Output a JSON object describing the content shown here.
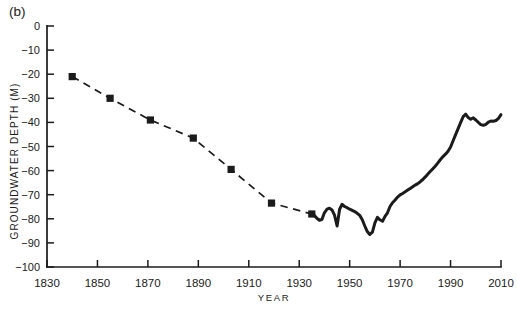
{
  "figure": {
    "background": "#ffffff",
    "ink_color": "#1b1b1b"
  },
  "chart_data": {
    "type": "line",
    "panel_label": "(b)",
    "title": "",
    "xlabel": "YEAR",
    "ylabel": "GROUNDWATER DEPTH (M)",
    "xlim": [
      1830,
      2010
    ],
    "ylim": [
      -100,
      0
    ],
    "x_ticks": [
      1830,
      1850,
      1870,
      1890,
      1910,
      1930,
      1950,
      1970,
      1990,
      2010
    ],
    "y_ticks": [
      0,
      -10,
      -20,
      -30,
      -40,
      -50,
      -60,
      -70,
      -80,
      -90,
      -100
    ],
    "grid": false,
    "legend": "none",
    "series": [
      {
        "name": "historical spot measurements",
        "style": "dashed",
        "marker": "filled-square",
        "points": [
          [
            1840,
            -21
          ],
          [
            1855,
            -30
          ],
          [
            1871,
            -39
          ],
          [
            1888,
            -46.5
          ],
          [
            1903,
            -59.5
          ],
          [
            1919,
            -73.5
          ],
          [
            1935,
            -78
          ]
        ]
      },
      {
        "name": "continuous record",
        "style": "solid",
        "marker": "none",
        "points": [
          [
            1935,
            -78
          ],
          [
            1936,
            -78.6
          ],
          [
            1937,
            -79.8
          ],
          [
            1938,
            -80.6
          ],
          [
            1939,
            -80.3
          ],
          [
            1940,
            -77.5
          ],
          [
            1941,
            -76
          ],
          [
            1942,
            -75.6
          ],
          [
            1943,
            -76.3
          ],
          [
            1944,
            -78.5
          ],
          [
            1945,
            -83
          ],
          [
            1946,
            -76
          ],
          [
            1947,
            -74
          ],
          [
            1948,
            -74.9
          ],
          [
            1949,
            -75.4
          ],
          [
            1950,
            -76
          ],
          [
            1951,
            -76.5
          ],
          [
            1952,
            -77
          ],
          [
            1953,
            -77.7
          ],
          [
            1954,
            -78.6
          ],
          [
            1955,
            -80.4
          ],
          [
            1956,
            -83
          ],
          [
            1957,
            -85.3
          ],
          [
            1958,
            -86.5
          ],
          [
            1959,
            -85.5
          ],
          [
            1960,
            -81.7
          ],
          [
            1961,
            -79.4
          ],
          [
            1962,
            -80.4
          ],
          [
            1963,
            -81
          ],
          [
            1964,
            -79
          ],
          [
            1965,
            -77.5
          ],
          [
            1966,
            -74.9
          ],
          [
            1967,
            -73.3
          ],
          [
            1968,
            -72.2
          ],
          [
            1969,
            -71
          ],
          [
            1970,
            -70.1
          ],
          [
            1971,
            -69.5
          ],
          [
            1972,
            -68.8
          ],
          [
            1973,
            -68.1
          ],
          [
            1974,
            -67.4
          ],
          [
            1975,
            -66.7
          ],
          [
            1976,
            -66
          ],
          [
            1977,
            -65.4
          ],
          [
            1978,
            -64.6
          ],
          [
            1979,
            -63.7
          ],
          [
            1980,
            -62.6
          ],
          [
            1981,
            -61.4
          ],
          [
            1982,
            -60.3
          ],
          [
            1983,
            -59.2
          ],
          [
            1984,
            -58.1
          ],
          [
            1985,
            -56.8
          ],
          [
            1986,
            -55.4
          ],
          [
            1987,
            -54.2
          ],
          [
            1988,
            -53.2
          ],
          [
            1989,
            -52
          ],
          [
            1990,
            -50.2
          ],
          [
            1991,
            -47.6
          ],
          [
            1992,
            -45.1
          ],
          [
            1993,
            -42.6
          ],
          [
            1994,
            -40.1
          ],
          [
            1995,
            -37.6
          ],
          [
            1996,
            -36.6
          ],
          [
            1997,
            -38
          ],
          [
            1998,
            -38.7
          ],
          [
            1999,
            -38.1
          ],
          [
            2000,
            -39
          ],
          [
            2001,
            -40
          ],
          [
            2002,
            -40.9
          ],
          [
            2003,
            -41.2
          ],
          [
            2004,
            -40.8
          ],
          [
            2005,
            -39.9
          ],
          [
            2006,
            -39.4
          ],
          [
            2007,
            -39.5
          ],
          [
            2008,
            -39.2
          ],
          [
            2009,
            -38.3
          ],
          [
            2010,
            -36.8
          ]
        ]
      }
    ]
  }
}
